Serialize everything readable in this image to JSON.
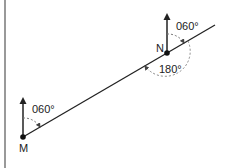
{
  "diagram": {
    "points": {
      "M": {
        "label": "M"
      },
      "N": {
        "label": "N"
      }
    },
    "angles": {
      "bearing_M": "060°",
      "bearing_N": "060°",
      "angle_N_back": "180°"
    },
    "colors": {
      "line": "#222222",
      "dashed": "#888888",
      "border": "#777777"
    }
  }
}
